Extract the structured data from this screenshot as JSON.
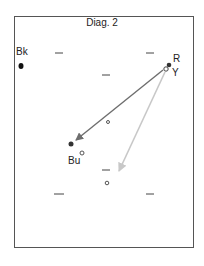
{
  "diagram": {
    "title": "Diag. 2",
    "labels": {
      "bk": "Bk",
      "r": "R",
      "y": "Y",
      "bu": "Bu"
    },
    "colors": {
      "frame": "#555555",
      "dark_arrow": "#6e6e6e",
      "light_arrow": "#c8c8c8",
      "dot": "#333333",
      "dash": "#444444"
    },
    "points": [
      {
        "name": "Bk",
        "x": 21,
        "y": 66,
        "filled": true
      },
      {
        "name": "R",
        "x": 169,
        "y": 65,
        "filled": true
      },
      {
        "name": "Y",
        "x": 166,
        "y": 69,
        "filled": false
      },
      {
        "name": "Bu",
        "x": 71,
        "y": 144,
        "filled": true
      },
      {
        "name": "near-Bu",
        "x": 82,
        "y": 153,
        "filled": false
      },
      {
        "name": "center",
        "x": 108,
        "y": 122,
        "filled": false
      },
      {
        "name": "lower-center",
        "x": 107,
        "y": 183,
        "filled": false
      }
    ],
    "arrows": [
      {
        "name": "R-to-Bu",
        "from": [
          163,
          70
        ],
        "to": [
          74,
          142
        ],
        "shade": "dark"
      },
      {
        "name": "Y-to-lower",
        "from": [
          165,
          72
        ],
        "to": [
          118,
          173
        ],
        "shade": "light"
      }
    ],
    "dashes": [
      {
        "x": 59,
        "y": 53
      },
      {
        "x": 150,
        "y": 53
      },
      {
        "x": 106,
        "y": 75
      },
      {
        "x": 106,
        "y": 170
      },
      {
        "x": 59,
        "y": 194
      },
      {
        "x": 150,
        "y": 194
      }
    ]
  }
}
